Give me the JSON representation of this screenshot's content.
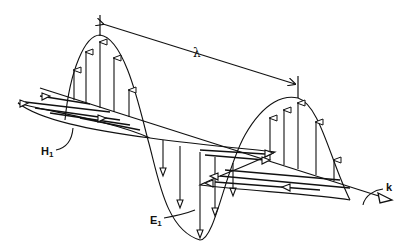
{
  "figure": {
    "type": "electromagnetic-wave-diagram",
    "labels": {
      "wavelength": "λ",
      "magnetic_field": "H",
      "magnetic_field_sub": "1",
      "electric_field": "E",
      "electric_field_sub": "1",
      "propagation": "k"
    },
    "colors": {
      "ink": "#111111",
      "background": "#ffffff"
    }
  }
}
